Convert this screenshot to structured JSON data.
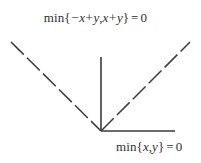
{
  "figure": {
    "name": "min-function-zero-level-set",
    "background_color": "#ffffff",
    "line_color": "#3a3a3a",
    "text_color": "#2f2f2f",
    "width": 201,
    "height": 163
  },
  "labels": {
    "top": {
      "full_text": "min{-x+y,x+y} = 0",
      "operator": "min",
      "open_brace": "{",
      "minus": "−",
      "var_x1": "x",
      "plus1": "+",
      "var_y1": "y",
      "comma": ",",
      "var_x2": "x",
      "plus2": "+",
      "var_y2": "y",
      "close_brace": "}",
      "equals": "=",
      "value": "0"
    },
    "bottom": {
      "full_text": "min{x,y} = 0",
      "operator": "min",
      "open_brace": "{",
      "var_x": "x",
      "comma": ",",
      "var_y": "y",
      "close_brace": "}",
      "equals": "=",
      "value": "0"
    }
  },
  "chart_data": {
    "type": "line",
    "title": "",
    "xlabel": "",
    "ylabel": "",
    "grid": false,
    "legend": null,
    "annotations": [
      {
        "text": "min{-x+y,x+y} = 0",
        "x": 105,
        "y": 18,
        "target": "dashed-v-rays"
      },
      {
        "text": "min{x,y} = 0",
        "x": 148,
        "y": 147,
        "target": "solid-rays"
      }
    ],
    "vertex": {
      "x": 101,
      "y": 131
    },
    "series": [
      {
        "name": "vertical-solid-ray",
        "style": "solid",
        "points": [
          {
            "x": 101,
            "y": 57
          },
          {
            "x": 101,
            "y": 131
          }
        ]
      },
      {
        "name": "horizontal-solid-ray",
        "style": "solid",
        "points": [
          {
            "x": 101,
            "y": 131
          },
          {
            "x": 175,
            "y": 131
          }
        ]
      },
      {
        "name": "left-dashed-ray",
        "style": "dashed",
        "points": [
          {
            "x": 11,
            "y": 42
          },
          {
            "x": 101,
            "y": 131
          }
        ]
      },
      {
        "name": "right-dashed-ray",
        "style": "dashed",
        "points": [
          {
            "x": 101,
            "y": 131
          },
          {
            "x": 190,
            "y": 42
          }
        ]
      }
    ]
  }
}
